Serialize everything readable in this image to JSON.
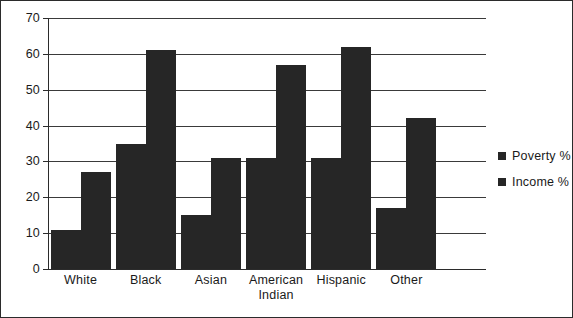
{
  "chart_data": {
    "type": "bar",
    "title": "",
    "xlabel": "",
    "ylabel": "",
    "ylim": [
      0,
      70
    ],
    "ytick_step": 10,
    "yticks": [
      70,
      60,
      50,
      40,
      30,
      20,
      10,
      0
    ],
    "grid": true,
    "legend_position": "right",
    "categories": [
      "White",
      "Black",
      "Asian",
      "American Indian",
      "Hispanic",
      "Other"
    ],
    "category_lines": [
      [
        "White"
      ],
      [
        "Black"
      ],
      [
        "Asian"
      ],
      [
        "American",
        "Indian"
      ],
      [
        "Hispanic"
      ],
      [
        "Other"
      ]
    ],
    "series": [
      {
        "name": "Poverty %",
        "color": "#262626",
        "values": [
          11,
          35,
          15,
          31,
          31,
          17
        ]
      },
      {
        "name": "Income %",
        "color": "#262626",
        "values": [
          27,
          61,
          31,
          57,
          62,
          42
        ]
      }
    ]
  },
  "colors": {
    "bar_fill": "#262626",
    "gridline": "#3a3a3a",
    "axis": "#2b2b2b",
    "frame": "#2b2b2b",
    "text": "#1a1a1a",
    "background": "#ffffff"
  }
}
